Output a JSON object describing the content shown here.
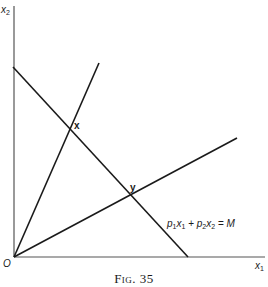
{
  "figure": {
    "caption_prefix": "Fig.",
    "caption_number": "35",
    "axes": {
      "x_label_base": "x",
      "x_label_sub": "1",
      "y_label_base": "x",
      "y_label_sub": "2",
      "origin_label": "O"
    },
    "points": {
      "x_label": "x",
      "y_label": "y"
    },
    "budget_line": {
      "p1": "p",
      "p1_sub": "1",
      "x1": "x",
      "x1_sub": "1",
      "plus": "+",
      "p2": "p",
      "p2_sub": "2",
      "x2": "x",
      "x2_sub": "2",
      "equals": "=",
      "rhs": "M"
    },
    "colors": {
      "ink": "#1a1a1a",
      "axis": "#555555",
      "background": "#ffffff"
    }
  }
}
